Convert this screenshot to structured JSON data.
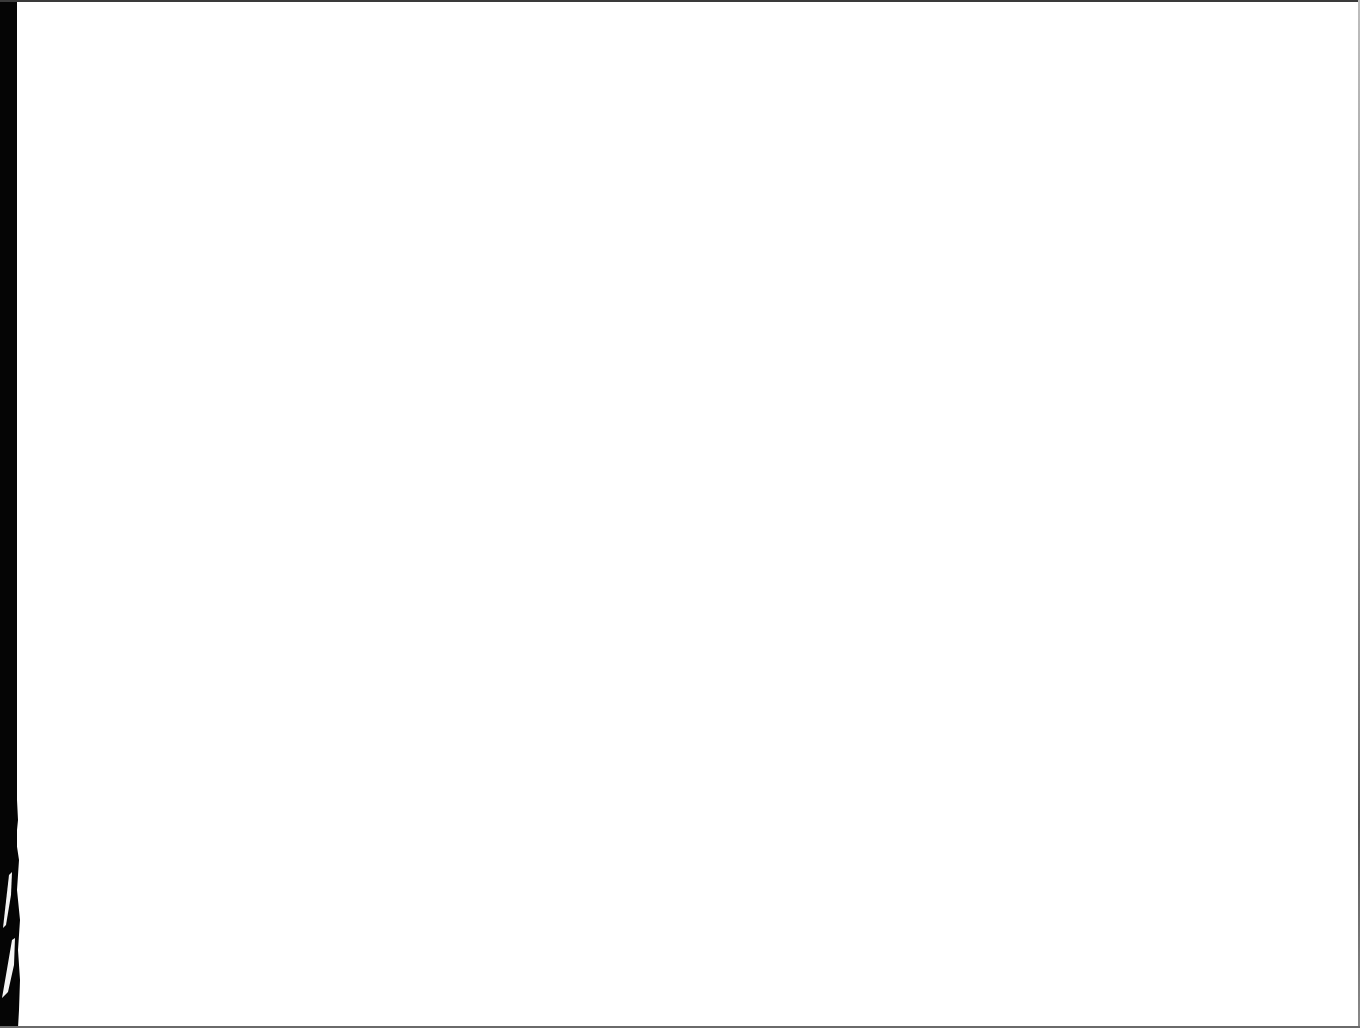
{
  "page": {
    "kind": "blank-scanned-page",
    "background_color": "#ffffff",
    "edge_color": "#050505",
    "content": []
  }
}
